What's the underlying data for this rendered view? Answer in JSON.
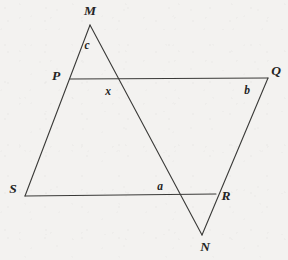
{
  "figure": {
    "background_color": "#f3f2f0",
    "stroke_color": "#3a3a38",
    "stroke_width": 1.1,
    "width": 288,
    "height": 260
  },
  "points": {
    "M": {
      "label": "M",
      "x": 90,
      "y": 25,
      "label_x": 90,
      "label_y": 11
    },
    "P": {
      "label": "P",
      "x": 70,
      "y": 79,
      "label_x": 56,
      "label_y": 76
    },
    "Q": {
      "label": "Q",
      "x": 268,
      "y": 78,
      "label_x": 276,
      "label_y": 71
    },
    "S": {
      "label": "S",
      "x": 25,
      "y": 196,
      "label_x": 13,
      "label_y": 189
    },
    "R": {
      "label": "R",
      "x": 216,
      "y": 194,
      "label_x": 226,
      "label_y": 196
    },
    "N": {
      "label": "N",
      "x": 202,
      "y": 235,
      "label_x": 205,
      "label_y": 247
    }
  },
  "segments": [
    {
      "name": "M-to-S",
      "from": "M",
      "to": "S",
      "through": [
        "P"
      ]
    },
    {
      "name": "M-to-N",
      "from": "M",
      "to": "N"
    },
    {
      "name": "P-to-Q",
      "from": "P",
      "to": "Q"
    },
    {
      "name": "S-to-R",
      "from": "S",
      "to": "R"
    },
    {
      "name": "Q-to-N",
      "from": "Q",
      "to": "N",
      "through": [
        "R"
      ]
    }
  ],
  "angle_labels": [
    {
      "name": "angle-c",
      "text": "c",
      "x": 87,
      "y": 46
    },
    {
      "name": "angle-x",
      "text": "x",
      "x": 108,
      "y": 92
    },
    {
      "name": "angle-b",
      "text": "b",
      "x": 247,
      "y": 91
    },
    {
      "name": "angle-a",
      "text": "a",
      "x": 160,
      "y": 187
    }
  ]
}
